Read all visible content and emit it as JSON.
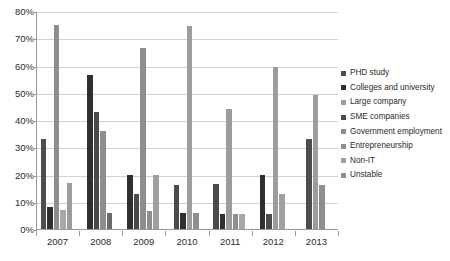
{
  "chart_data": {
    "type": "bar",
    "title": "",
    "subtitle": "",
    "xlabel": "",
    "ylabel": "",
    "categories": [
      "2007",
      "2008",
      "2009",
      "2010",
      "2011",
      "2012",
      "2013"
    ],
    "ylim": [
      0,
      80
    ],
    "ytick_labels": [
      "0%",
      "10%",
      "20%",
      "30%",
      "40%",
      "50%",
      "60%",
      "70%",
      "80%"
    ],
    "ytick_values": [
      0,
      10,
      20,
      30,
      40,
      50,
      60,
      70,
      80
    ],
    "grid": true,
    "legend_position": "right",
    "value_suffix": "%",
    "series": [
      {
        "name": "PHD study",
        "color": "#4d4d4d",
        "values": [
          33,
          0,
          0,
          0,
          0,
          0,
          33
        ]
      },
      {
        "name": "Colleges and university",
        "color": "#2f2f2f",
        "values": [
          8,
          56.5,
          20,
          16,
          16.5,
          20,
          0
        ]
      },
      {
        "name": "Large company",
        "color": "#8e8e8e",
        "values": [
          75,
          43,
          13,
          6,
          5.5,
          5.5,
          49
        ]
      },
      {
        "name": "SME companies",
        "color": "#6b6b6b",
        "values": [
          0,
          36,
          0,
          0,
          0,
          0,
          0
        ]
      },
      {
        "name": "Government employment",
        "color": "#a8a8a8",
        "values": [
          7,
          6,
          6.5,
          6,
          5.5,
          13,
          0
        ]
      },
      {
        "name": "Entrepreneurship",
        "color": "#9c9c9c",
        "values": [
          17,
          0,
          20,
          74.5,
          5.5,
          59.5,
          0
        ]
      },
      {
        "name": "Non-IT",
        "color": "#858585",
        "values": [
          0,
          0,
          66.5,
          0,
          44,
          0,
          16
        ]
      },
      {
        "name": "Unstable",
        "color": "#767676",
        "values": [
          0,
          0,
          0,
          0,
          0,
          0,
          0
        ]
      }
    ],
    "groups": [
      {
        "category": "2007",
        "bars": [
          {
            "series": "PHD study",
            "value": 33,
            "color": "#4d4d4d"
          },
          {
            "series": "Colleges and university",
            "value": 8,
            "color": "#2f2f2f"
          },
          {
            "series": "Large company",
            "value": 75,
            "color": "#8e8e8e"
          },
          {
            "series": "Government employment",
            "value": 7,
            "color": "#a8a8a8"
          },
          {
            "series": "Entrepreneurship",
            "value": 17,
            "color": "#9c9c9c"
          }
        ]
      },
      {
        "category": "2008",
        "bars": [
          {
            "series": "Colleges and university",
            "value": 56.5,
            "color": "#2f2f2f"
          },
          {
            "series": "Large company",
            "value": 43,
            "color": "#4a4a4a"
          },
          {
            "series": "SME companies",
            "value": 36,
            "color": "#8e8e8e"
          },
          {
            "series": "Government employment",
            "value": 6,
            "color": "#6b6b6b"
          }
        ]
      },
      {
        "category": "2009",
        "bars": [
          {
            "series": "Colleges and university",
            "value": 20,
            "color": "#2f2f2f"
          },
          {
            "series": "Large company",
            "value": 13,
            "color": "#4a4a4a"
          },
          {
            "series": "Non-IT",
            "value": 66.5,
            "color": "#8e8e8e"
          },
          {
            "series": "Government employment",
            "value": 6.5,
            "color": "#8e8e8e"
          },
          {
            "series": "Entrepreneurship",
            "value": 20,
            "color": "#a0a0a0"
          }
        ]
      },
      {
        "category": "2010",
        "bars": [
          {
            "series": "Colleges and university",
            "value": 16,
            "color": "#4a4a4a"
          },
          {
            "series": "Large company",
            "value": 6,
            "color": "#2f2f2f"
          },
          {
            "series": "Entrepreneurship",
            "value": 74.5,
            "color": "#9c9c9c"
          },
          {
            "series": "Government employment",
            "value": 6,
            "color": "#8e8e8e"
          }
        ]
      },
      {
        "category": "2011",
        "bars": [
          {
            "series": "Colleges and university",
            "value": 16.5,
            "color": "#4a4a4a"
          },
          {
            "series": "Large company",
            "value": 5.5,
            "color": "#2f2f2f"
          },
          {
            "series": "Non-IT",
            "value": 44,
            "color": "#9c9c9c"
          },
          {
            "series": "Government employment",
            "value": 5.5,
            "color": "#8e8e8e"
          },
          {
            "series": "Entrepreneurship",
            "value": 5.5,
            "color": "#a8a8a8"
          }
        ]
      },
      {
        "category": "2012",
        "bars": [
          {
            "series": "Colleges and university",
            "value": 20,
            "color": "#2f2f2f"
          },
          {
            "series": "Large company",
            "value": 5.5,
            "color": "#4a4a4a"
          },
          {
            "series": "Entrepreneurship",
            "value": 59.5,
            "color": "#9c9c9c"
          },
          {
            "series": "Government employment",
            "value": 13,
            "color": "#a0a0a0"
          }
        ]
      },
      {
        "category": "2013",
        "bars": [
          {
            "series": "PHD study",
            "value": 33,
            "color": "#4d4d4d"
          },
          {
            "series": "Large company",
            "value": 49,
            "color": "#9c9c9c"
          },
          {
            "series": "Non-IT",
            "value": 16,
            "color": "#8e8e8e"
          }
        ]
      }
    ]
  },
  "legend": {
    "items": [
      {
        "label": "PHD study",
        "color": "#4d4d4d"
      },
      {
        "label": "Colleges and university",
        "color": "#2f2f2f"
      },
      {
        "label": "Large company",
        "color": "#9c9c9c"
      },
      {
        "label": "SME companies",
        "color": "#4a4a4a"
      },
      {
        "label": "Government employment",
        "color": "#8e8e8e"
      },
      {
        "label": "Entrepreneurship",
        "color": "#8e8e8e"
      },
      {
        "label": "Non-IT",
        "color": "#a0a0a0"
      },
      {
        "label": "Unstable",
        "color": "#8e8e8e"
      }
    ]
  }
}
